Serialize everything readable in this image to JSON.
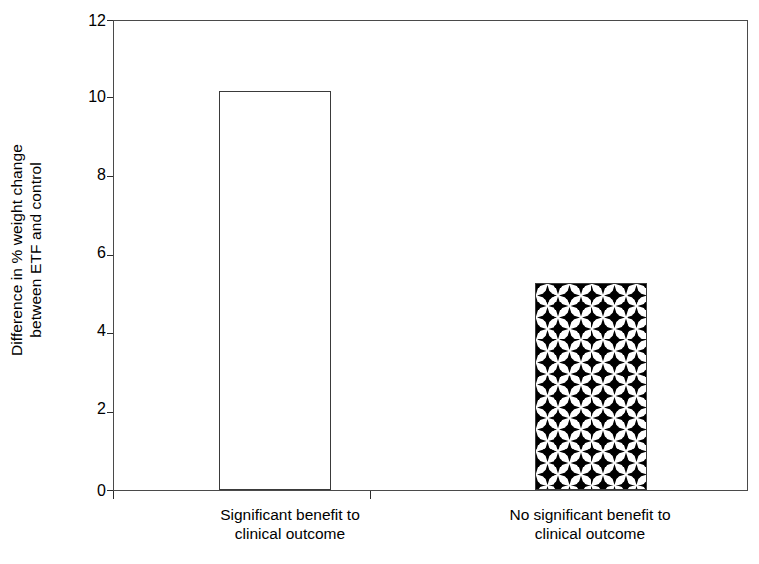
{
  "chart_data": {
    "type": "bar",
    "title": "",
    "xlabel": "",
    "ylabel": "Difference in % weight change between ETF and control",
    "ylabel_line1": "Difference in % weight change",
    "ylabel_line2": "between ETF and control",
    "categories": [
      "Significant benefit to clinical outcome",
      "No significant benefit to clinical outcome"
    ],
    "category_lines": [
      {
        "line1": "Significant benefit to",
        "line2": "clinical outcome"
      },
      {
        "line1": "No significant benefit to",
        "line2": "clinical outcome"
      }
    ],
    "values": [
      10.2,
      5.3
    ],
    "ylim": [
      0,
      12
    ],
    "yticks": [
      0,
      2,
      4,
      6,
      8,
      10,
      12
    ],
    "ytick_labels": [
      "0",
      "2",
      "4",
      "6",
      "8",
      "10",
      "12"
    ],
    "grid": false,
    "legend": "none",
    "bar_styles": [
      {
        "name": "open-white-bar",
        "fill": "#ffffff",
        "edge": "#3a3a3a",
        "pattern": "none"
      },
      {
        "name": "diamond-pattern-bar",
        "fill": "#ffffff",
        "edge": "#3a3a3a",
        "pattern": "four-pointed-star-diamond"
      }
    ],
    "colors": {
      "axis": "#4a4a4a",
      "text": "#000000",
      "pattern": "#000000",
      "background": "#ffffff"
    }
  }
}
